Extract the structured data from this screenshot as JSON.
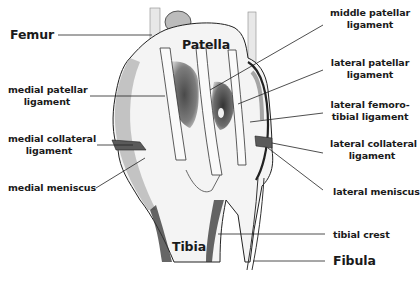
{
  "diagram": {
    "labels": {
      "femur": "Femur",
      "patella": "Patella",
      "tibia": "Tibia",
      "fibula": "Fibula",
      "medial_patellar_ligament": [
        "medial patellar",
        "ligament"
      ],
      "medial_collateral_ligament": [
        "medial collateral",
        "ligament"
      ],
      "medial_meniscus": "medial meniscus",
      "middle_patellar_ligament": [
        "middle patellar",
        "ligament"
      ],
      "lateral_patellar_ligament": [
        "lateral patellar",
        "ligament"
      ],
      "lateral_femorotibial_ligament": [
        "lateral femoro-",
        "tibial ligament"
      ],
      "lateral_collateral_ligament": [
        "lateral collateral",
        "ligament"
      ],
      "lateral_meniscus": "lateral meniscus",
      "tibial_crest": "tibial crest"
    }
  }
}
